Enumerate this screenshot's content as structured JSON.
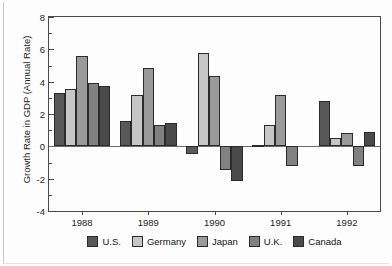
{
  "figure": {
    "bleed_text": "",
    "ylabel": "Growth Rate in GDP (Annual Rate)"
  },
  "chart_data": {
    "type": "bar",
    "title": "",
    "xlabel": "",
    "ylabel": "Growth Rate in GDP (Annual Rate)",
    "categories": [
      "1988",
      "1989",
      "1990",
      "1991",
      "1992"
    ],
    "series": [
      {
        "name": "U.S.",
        "color": "#585858",
        "values": [
          3.3,
          1.55,
          -0.5,
          0.1,
          2.8
        ]
      },
      {
        "name": "Germany",
        "color": "#c6c6c6",
        "values": [
          3.55,
          3.2,
          5.8,
          1.3,
          0.5
        ]
      },
      {
        "name": "Japan",
        "color": "#9a9a9a",
        "values": [
          5.6,
          4.85,
          4.35,
          3.15,
          0.8
        ]
      },
      {
        "name": "U.K.",
        "color": "#818181",
        "values": [
          3.9,
          1.35,
          -1.45,
          -1.2,
          -1.2
        ]
      },
      {
        "name": "Canada",
        "color": "#4a4a4a",
        "values": [
          3.75,
          1.45,
          -2.15,
          0.0,
          0.9
        ]
      }
    ],
    "ylim": [
      -4,
      8
    ],
    "ytick_values": [
      -4,
      -2,
      0,
      2,
      4,
      6,
      8
    ],
    "ytick_labels": [
      "-4",
      "-2",
      "0",
      "2",
      "4",
      "6",
      "8"
    ],
    "yminor_values": [
      -3,
      -1,
      1,
      3,
      5,
      7
    ],
    "grid": false,
    "zero_line": true,
    "legend_position": "bottom"
  }
}
